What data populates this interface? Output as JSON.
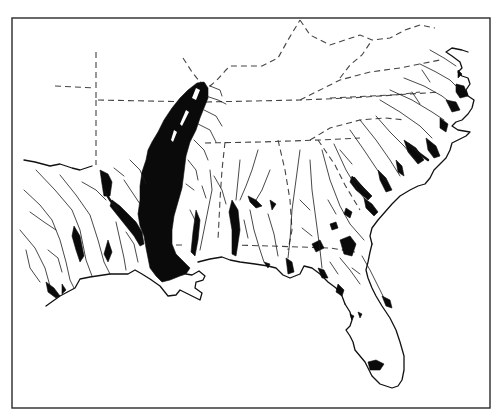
{
  "map": {
    "region": "Southeastern United States",
    "style": "black-and-white line map",
    "colors": {
      "background": "#ffffff",
      "frame": "#2a2a2a",
      "land_outline": "#111111",
      "state_boundary": "#444444",
      "river": "#1a1a1a",
      "wetland_fill": "#0a0a0a"
    },
    "frame": {
      "x": 12,
      "y": 18,
      "width": 478,
      "height": 390
    },
    "layers": [
      {
        "id": "state-boundaries",
        "style": "dashed"
      },
      {
        "id": "rivers",
        "style": "thin solid lines"
      },
      {
        "id": "floodplain-wetlands",
        "style": "solid black fill"
      },
      {
        "id": "mississippi-alluvial-valley",
        "style": "large solid black fill"
      },
      {
        "id": "coastline",
        "style": "solid outline"
      }
    ],
    "labels": []
  }
}
